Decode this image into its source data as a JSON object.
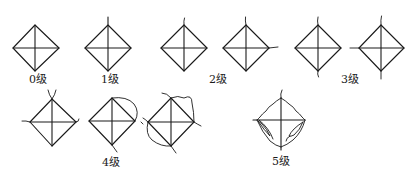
{
  "figure": {
    "stroke_color": "#1a1a1a",
    "background_color": "#ffffff"
  },
  "grades": [
    {
      "id": "grade-0",
      "label": "0级"
    },
    {
      "id": "grade-1",
      "label": "1级"
    },
    {
      "id": "grade-2",
      "label": "2级"
    },
    {
      "id": "grade-3",
      "label": "3级"
    },
    {
      "id": "grade-4",
      "label": "4级"
    },
    {
      "id": "grade-5",
      "label": "5级"
    }
  ]
}
